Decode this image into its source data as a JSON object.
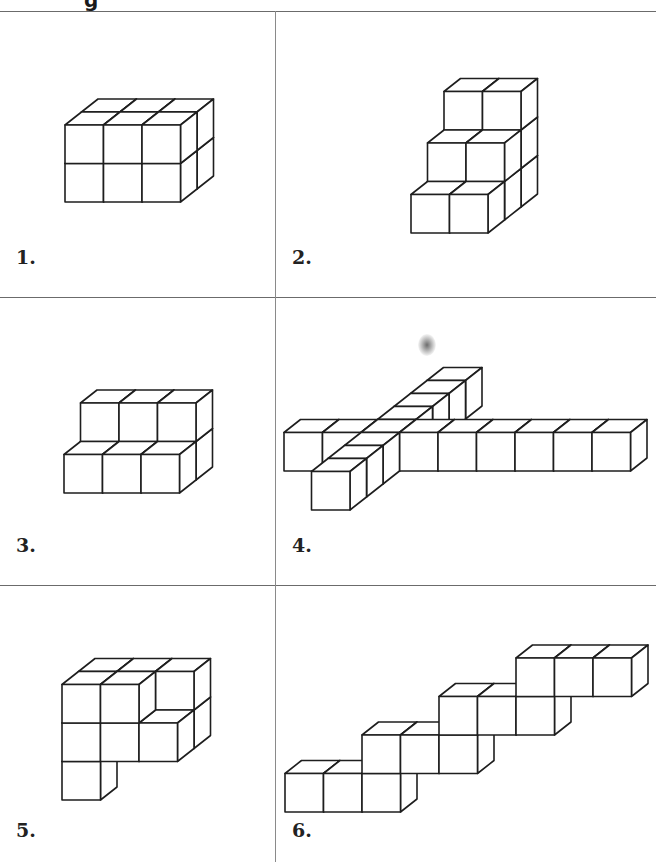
{
  "header": {
    "title_fragment": "g"
  },
  "style": {
    "line_color": "#1e1e1e",
    "fill_color": "#ffffff",
    "grid_line_color": "#6b6b6b"
  },
  "projection": {
    "cube_size": 38.5,
    "depth_dx": 16.5,
    "depth_dy": -13
  },
  "cells": [
    {
      "label": "1.",
      "label_pos": [
        16,
        265
      ],
      "origin": [
        65,
        202
      ],
      "cubes": [
        [
          0,
          0,
          0
        ],
        [
          1,
          0,
          0
        ],
        [
          2,
          0,
          0
        ],
        [
          0,
          1,
          0
        ],
        [
          1,
          1,
          0
        ],
        [
          2,
          1,
          0
        ],
        [
          0,
          0,
          1
        ],
        [
          1,
          0,
          1
        ],
        [
          2,
          0,
          1
        ],
        [
          0,
          1,
          1
        ],
        [
          1,
          1,
          1
        ],
        [
          2,
          1,
          1
        ]
      ]
    },
    {
      "label": "2.",
      "label_pos": [
        292,
        265
      ],
      "origin": [
        411,
        233
      ],
      "cubes": [
        [
          0,
          0,
          0
        ],
        [
          1,
          0,
          0
        ],
        [
          0,
          0,
          1
        ],
        [
          1,
          0,
          1
        ],
        [
          0,
          1,
          1
        ],
        [
          1,
          1,
          1
        ],
        [
          0,
          0,
          2
        ],
        [
          1,
          0,
          2
        ],
        [
          0,
          1,
          2
        ],
        [
          1,
          1,
          2
        ],
        [
          0,
          2,
          2
        ],
        [
          1,
          2,
          2
        ]
      ]
    },
    {
      "label": "3.",
      "label_pos": [
        16,
        553
      ],
      "origin": [
        64,
        493
      ],
      "cubes": [
        [
          0,
          0,
          0
        ],
        [
          1,
          0,
          0
        ],
        [
          2,
          0,
          0
        ],
        [
          0,
          0,
          1
        ],
        [
          1,
          0,
          1
        ],
        [
          2,
          0,
          1
        ],
        [
          0,
          1,
          1
        ],
        [
          1,
          1,
          1
        ],
        [
          2,
          1,
          1
        ]
      ]
    },
    {
      "label": "4.",
      "label_pos": [
        292,
        553
      ],
      "origin": [
        284,
        471
      ],
      "cubes": [
        [
          0,
          0,
          0
        ],
        [
          1,
          0,
          0
        ],
        [
          2,
          0,
          0
        ],
        [
          3,
          0,
          0
        ],
        [
          4,
          0,
          0
        ],
        [
          5,
          0,
          0
        ],
        [
          6,
          0,
          0
        ],
        [
          7,
          0,
          0
        ],
        [
          8,
          0,
          0
        ],
        [
          2,
          0,
          -3
        ],
        [
          2,
          0,
          -2
        ],
        [
          2,
          0,
          -1
        ],
        [
          2,
          0,
          1
        ],
        [
          2,
          0,
          2
        ],
        [
          2,
          0,
          3
        ],
        [
          2,
          0,
          4
        ]
      ]
    },
    {
      "label": "5.",
      "label_pos": [
        16,
        838
      ],
      "origin": [
        62,
        800
      ],
      "cubes": [
        [
          0,
          0,
          0
        ],
        [
          0,
          1,
          0
        ],
        [
          1,
          1,
          0
        ],
        [
          2,
          1,
          0
        ],
        [
          0,
          2,
          0
        ],
        [
          1,
          2,
          0
        ],
        [
          2,
          1,
          1
        ],
        [
          0,
          2,
          1
        ],
        [
          1,
          2,
          1
        ],
        [
          2,
          2,
          1
        ]
      ]
    },
    {
      "label": "6.",
      "label_pos": [
        292,
        838
      ],
      "origin": [
        285,
        812
      ],
      "cubes": [
        [
          0,
          0,
          0
        ],
        [
          1,
          0,
          0
        ],
        [
          2,
          0,
          0
        ],
        [
          2,
          1,
          0
        ],
        [
          3,
          1,
          0
        ],
        [
          4,
          1,
          0
        ],
        [
          4,
          2,
          0
        ],
        [
          5,
          2,
          0
        ],
        [
          6,
          2,
          0
        ],
        [
          6,
          3,
          0
        ],
        [
          7,
          3,
          0
        ],
        [
          8,
          3,
          0
        ]
      ]
    }
  ],
  "decorations": {
    "smudge": "ink-smudge"
  }
}
